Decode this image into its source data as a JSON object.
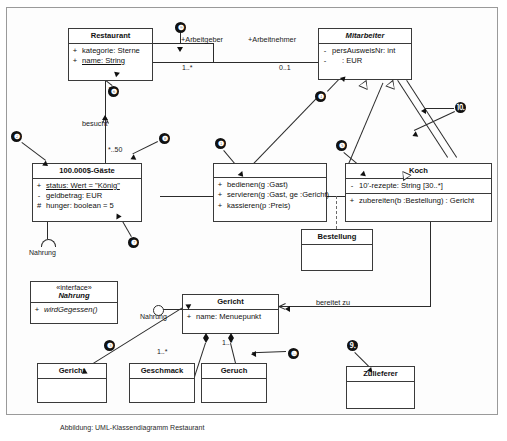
{
  "diagram": {
    "caption": "Abbildung: UML-Klassendiagramm Restaurant",
    "classes": [
      {
        "id": "restaurant",
        "name": "Restaurant",
        "attributes": [
          {
            "vis": "+",
            "text": "kategorie:  Sterne",
            "underline": false
          },
          {
            "vis": "+",
            "text": "name:  String",
            "underline": true
          }
        ],
        "operations": []
      },
      {
        "id": "mitarbeiter",
        "name": "Mitarbeiter",
        "abstract": true,
        "attributes": [
          {
            "vis": "-",
            "text": "persAusweisNr:  int",
            "underline": false
          },
          {
            "vis": "-",
            "text": ":  EUR",
            "underline": false
          }
        ],
        "operations": []
      },
      {
        "id": "gaeste",
        "name": "100.000$-Gäste",
        "attributes": [
          {
            "vis": "+",
            "text": "status:  Wert = \"König\"",
            "underline": true
          },
          {
            "vis": "-",
            "text": "geldbetrag:  EUR",
            "underline": false
          },
          {
            "vis": "#",
            "text": "hunger:  boolean = 5",
            "underline": false
          }
        ],
        "operations": []
      },
      {
        "id": "kellner",
        "name": "",
        "attributes": [],
        "operations": [
          {
            "vis": "+",
            "text": "bedienen(g :Gast)"
          },
          {
            "vis": "+",
            "text": "servieren(g :Gast, ge :Gericht)"
          },
          {
            "vis": "+",
            "text": "kassieren(p :Preis)"
          }
        ]
      },
      {
        "id": "koch",
        "name": "Koch",
        "attributes": [
          {
            "vis": "-",
            "text": "10'-rezepte:  String [30..*]",
            "underline": false
          }
        ],
        "operations": [
          {
            "vis": "+",
            "text": "zubereiten(b :Bestellung) : Gericht"
          }
        ]
      },
      {
        "id": "bestellung",
        "name": "Bestellung",
        "attributes": [],
        "operations": []
      },
      {
        "id": "nahrung_interface",
        "name": "Nahrung",
        "stereotype": "«interface»",
        "abstract": true,
        "attributes": [],
        "operations": [
          {
            "vis": "+",
            "text": "wirdGegessen()"
          }
        ]
      },
      {
        "id": "gericht_main",
        "name": "Gericht",
        "attributes": [
          {
            "vis": "+",
            "text": "name:  Menuepunkt",
            "underline": false
          }
        ],
        "operations": []
      },
      {
        "id": "gericht_dup",
        "name": "Gericht",
        "attributes": [],
        "operations": []
      },
      {
        "id": "geschmack",
        "name": "Geschmack",
        "attributes": [],
        "operations": []
      },
      {
        "id": "geruch",
        "name": "Geruch",
        "attributes": [],
        "operations": []
      },
      {
        "id": "zulieferer",
        "name": "Zulieferer",
        "attributes": [],
        "operations": []
      }
    ],
    "association_labels": [
      {
        "id": "rolle_arbeitgeber",
        "text": "+Arbeitgeber"
      },
      {
        "id": "rolle_arbeitnehmer",
        "text": "+Arbeitnehmer"
      },
      {
        "id": "mult_arbeitgeber",
        "text": "1..*"
      },
      {
        "id": "mult_arbeitnehmer",
        "text": "0..1"
      },
      {
        "id": "mult_restaurant_besucht",
        "text": "1"
      },
      {
        "id": "assoc_besucht",
        "text": "besucht"
      },
      {
        "id": "mult_gaeste_besucht",
        "text": "*..50"
      },
      {
        "id": "assoc_bereitet_zu",
        "text": "bereitet zu"
      },
      {
        "id": "iface_nahrung_required",
        "text": "Nahrung"
      },
      {
        "id": "iface_nahrung_provided",
        "text": "Nahrung"
      },
      {
        "id": "mult_geschmack",
        "text": "1..*"
      },
      {
        "id": "mult_geruch",
        "text": "1..*"
      }
    ],
    "markers": [
      {
        "n": "❶",
        "label": "1"
      },
      {
        "n": "❷",
        "label": "2"
      },
      {
        "n": "❸",
        "label": "3"
      },
      {
        "n": "❹",
        "label": "4"
      },
      {
        "n": "❺",
        "label": "5"
      },
      {
        "n": "❻",
        "label": "6"
      },
      {
        "n": "❼",
        "label": "7"
      },
      {
        "n": "❽",
        "label": "8"
      },
      {
        "n": "❾",
        "label": "9"
      },
      {
        "n": "❿",
        "label": "10"
      },
      {
        "n": "⒐",
        "label": "11"
      },
      {
        "n": "⒑",
        "label": "12"
      }
    ]
  }
}
